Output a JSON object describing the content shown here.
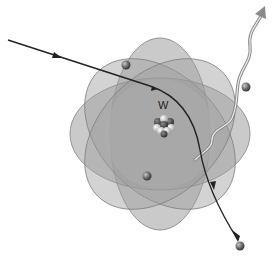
{
  "diagram": {
    "nucleus": {
      "label": "W",
      "center": [
        164,
        124
      ]
    },
    "atom_cloud": {
      "center": [
        160,
        134
      ],
      "fill_color": "#9a9a9a",
      "edge_color": "#7a7a7a"
    },
    "electrons": [
      {
        "name": "orbital-electron-1",
        "position": [
          126,
          65
        ]
      },
      {
        "name": "orbital-electron-2",
        "position": [
          147,
          176
        ]
      },
      {
        "name": "orbital-electron-3",
        "position": [
          246,
          87
        ]
      },
      {
        "name": "scattered-electron",
        "position": [
          240,
          246
        ]
      }
    ],
    "incident_path": {
      "description": "incoming electron path, deflected near nucleus",
      "color": "#222222"
    },
    "photon": {
      "description": "emitted photon (wavy arrow)",
      "color": "#9a9a9a",
      "inner_color": "#e8e8e8"
    }
  }
}
